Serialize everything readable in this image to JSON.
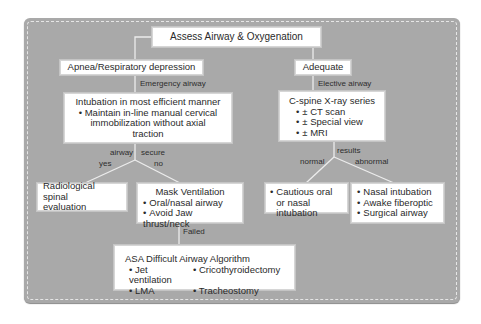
{
  "diagram": {
    "root": {
      "label": "Assess Airway & Oxygenation"
    },
    "left_branch": {
      "label": "Apnea/Respiratory depression",
      "edge_label": "Emergency airway",
      "intubation": {
        "title": "Intubation in most efficient manner",
        "bullets": [
          "Maintain in-line manual cervical immobilization without axial traction"
        ]
      },
      "decision": {
        "label_left": "airway",
        "label_right": "secure",
        "yes": "yes",
        "no": "no"
      },
      "yes_box": {
        "label": "Radiological spinal evaluation"
      },
      "no_box": {
        "title": "Mask Ventilation",
        "bullets": [
          "Oral/nasal airway",
          "Avoid Jaw thrust/neck"
        ]
      },
      "failed_label": "Failed",
      "asa_box": {
        "title": "ASA Difficult Airway Algorithm",
        "bullets": [
          "Jet ventilation",
          "Cricothyroidectomy",
          "LMA",
          "Tracheostomy"
        ]
      }
    },
    "right_branch": {
      "label": "Adequate",
      "edge_label": "Elective airway",
      "cspine": {
        "title": "C-spine X-ray series",
        "bullets": [
          "± CT scan",
          "± Special view",
          "± MRI"
        ]
      },
      "decision": {
        "label": "results",
        "normal": "normal",
        "abnormal": "abnormal"
      },
      "normal_box": {
        "bullets": [
          "Cautious oral or nasal intubation"
        ]
      },
      "abnormal_box": {
        "bullets": [
          "Nasal intubation",
          "Awake fiberoptic",
          "Surgical airway"
        ]
      }
    }
  },
  "colors": {
    "panel": "#a9a9a9",
    "box": "#ffffff",
    "connector": "#e8e8e8",
    "text": "#2a2a2a"
  }
}
